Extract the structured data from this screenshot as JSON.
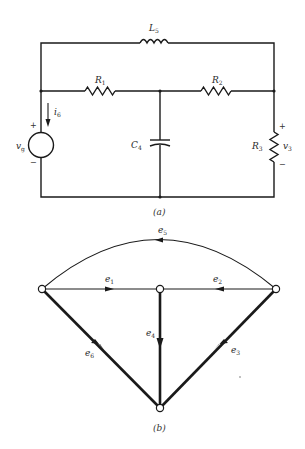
{
  "figure_a": {
    "caption": "(a)",
    "inductor": {
      "label": "L",
      "sub": "5"
    },
    "r1": {
      "label": "R",
      "sub": "1"
    },
    "r2": {
      "label": "R",
      "sub": "2"
    },
    "r3": {
      "label": "R",
      "sub": "3"
    },
    "capacitor": {
      "label": "C",
      "sub": "4"
    },
    "source": {
      "label": "v",
      "sub": "g",
      "plus": "+",
      "minus": "−"
    },
    "current": {
      "label": "i",
      "sub": "6"
    },
    "voltage": {
      "label": "v",
      "sub": "3",
      "plus": "+",
      "minus": "−"
    }
  },
  "figure_b": {
    "caption": "(b)",
    "edges": [
      {
        "id": "e1",
        "label": "e",
        "sub": "1",
        "direction": "right"
      },
      {
        "id": "e2",
        "label": "e",
        "sub": "2",
        "direction": "left"
      },
      {
        "id": "e3",
        "label": "e",
        "sub": "3",
        "direction": "down-left"
      },
      {
        "id": "e4",
        "label": "e",
        "sub": "4",
        "direction": "down"
      },
      {
        "id": "e5",
        "label": "e",
        "sub": "5",
        "direction": "left"
      },
      {
        "id": "e6",
        "label": "e",
        "sub": "6",
        "direction": "down-right"
      }
    ],
    "tree_edges": [
      "e3",
      "e4",
      "e6"
    ]
  }
}
